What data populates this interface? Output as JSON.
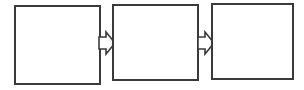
{
  "diagram": {
    "type": "flowchart",
    "title": "",
    "orientation": "horizontal",
    "background_color": "#ffffff",
    "stroke_color": "#3a3a3a",
    "fill_color": "#ffffff",
    "canvas": {
      "width": 304,
      "height": 90
    },
    "nodes": [
      {
        "id": "node-1",
        "label": "",
        "shape": "rectangle",
        "x": 15,
        "y": 6,
        "width": 85,
        "height": 78
      },
      {
        "id": "node-2",
        "label": "",
        "shape": "rectangle",
        "x": 113,
        "y": 5,
        "width": 85,
        "height": 75
      },
      {
        "id": "node-3",
        "label": "",
        "shape": "rectangle",
        "x": 212,
        "y": 4,
        "width": 81,
        "height": 75
      }
    ],
    "connectors": [
      {
        "id": "arrow-1",
        "label": "",
        "shape": "block-arrow",
        "direction": "right",
        "from": "node-1",
        "to": "node-2",
        "x": 99,
        "y": 32,
        "width": 16,
        "height": 22
      },
      {
        "id": "arrow-2",
        "label": "",
        "shape": "block-arrow",
        "direction": "right",
        "from": "node-2",
        "to": "node-3",
        "x": 198,
        "y": 32,
        "width": 16,
        "height": 22
      }
    ]
  }
}
